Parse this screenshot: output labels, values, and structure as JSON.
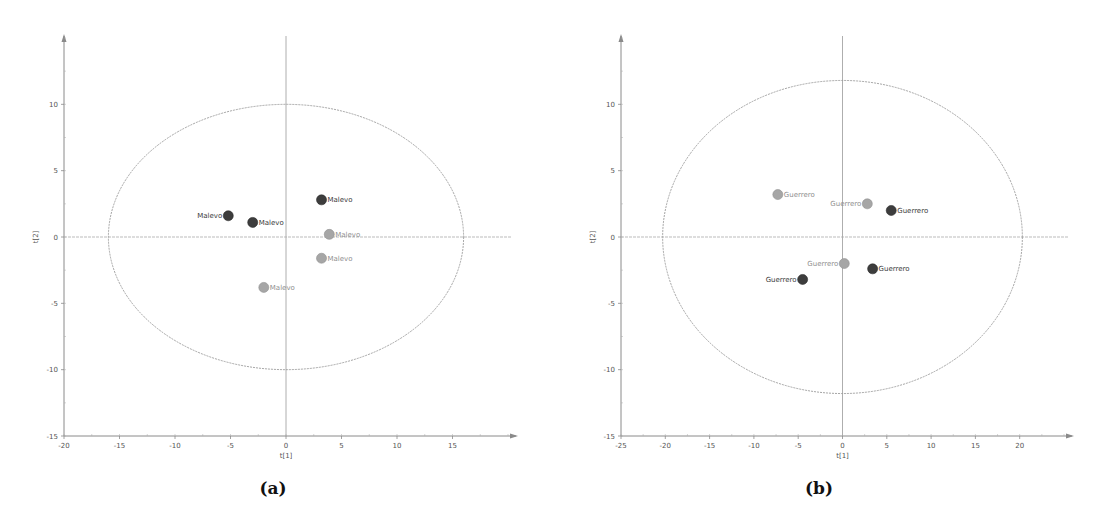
{
  "chart_data": [
    {
      "type": "scatter",
      "panel_label": "(a)",
      "title": "",
      "xlabel": "t[1]",
      "ylabel": "t[2]",
      "xlim": [
        -20,
        20
      ],
      "ylim": [
        -15,
        15
      ],
      "xticks": [
        -20,
        -15,
        -10,
        -5,
        0,
        5,
        10,
        15
      ],
      "yticks": [
        -15,
        -10,
        -5,
        0,
        5,
        10
      ],
      "grid": false,
      "ellipse": {
        "rx": 16.0,
        "ry": 10.0,
        "color": "#9a9a9a"
      },
      "label_colors": {
        "dark": "#3a3a3a",
        "light": "#8f8f8f"
      },
      "marker_colors": {
        "dark": "#3d3d3d",
        "light": "#a6a6a6"
      },
      "points": [
        {
          "x": -5.2,
          "y": 1.6,
          "label": "Malevo",
          "group": "dark",
          "label_side": "left"
        },
        {
          "x": -3.0,
          "y": 1.1,
          "label": "Malevo",
          "group": "dark",
          "label_side": "right"
        },
        {
          "x": 3.2,
          "y": 2.8,
          "label": "Malevo",
          "group": "dark",
          "label_side": "right"
        },
        {
          "x": 3.9,
          "y": 0.2,
          "label": "Malevo",
          "group": "light",
          "label_side": "right"
        },
        {
          "x": 3.2,
          "y": -1.6,
          "label": "Malevo",
          "group": "light",
          "label_side": "right"
        },
        {
          "x": -2.0,
          "y": -3.8,
          "label": "Malevo",
          "group": "light",
          "label_side": "right"
        }
      ]
    },
    {
      "type": "scatter",
      "panel_label": "(b)",
      "title": "",
      "xlabel": "t[1]",
      "ylabel": "t[2]",
      "xlim": [
        -25,
        25
      ],
      "ylim": [
        -15,
        15
      ],
      "xticks": [
        -25,
        -20,
        -15,
        -10,
        -5,
        0,
        5,
        10,
        15,
        20
      ],
      "yticks": [
        -15,
        -10,
        -5,
        0,
        5,
        10
      ],
      "grid": false,
      "ellipse": {
        "rx": 20.3,
        "ry": 11.8,
        "color": "#9a9a9a"
      },
      "label_colors": {
        "dark": "#3a3a3a",
        "light": "#8f8f8f"
      },
      "marker_colors": {
        "dark": "#3d3d3d",
        "light": "#a6a6a6"
      },
      "points": [
        {
          "x": -7.3,
          "y": 3.2,
          "label": "Guerrero",
          "group": "light",
          "label_side": "right"
        },
        {
          "x": 2.8,
          "y": 2.5,
          "label": "Guerrero",
          "group": "light",
          "label_side": "left"
        },
        {
          "x": 5.5,
          "y": 2.0,
          "label": "Guerrero",
          "group": "dark",
          "label_side": "right"
        },
        {
          "x": 0.2,
          "y": -2.0,
          "label": "Guerrero",
          "group": "light",
          "label_side": "left"
        },
        {
          "x": 3.4,
          "y": -2.4,
          "label": "Guerrero",
          "group": "dark",
          "label_side": "right"
        },
        {
          "x": -4.5,
          "y": -3.2,
          "label": "Guerrero",
          "group": "dark",
          "label_side": "left"
        }
      ]
    }
  ]
}
